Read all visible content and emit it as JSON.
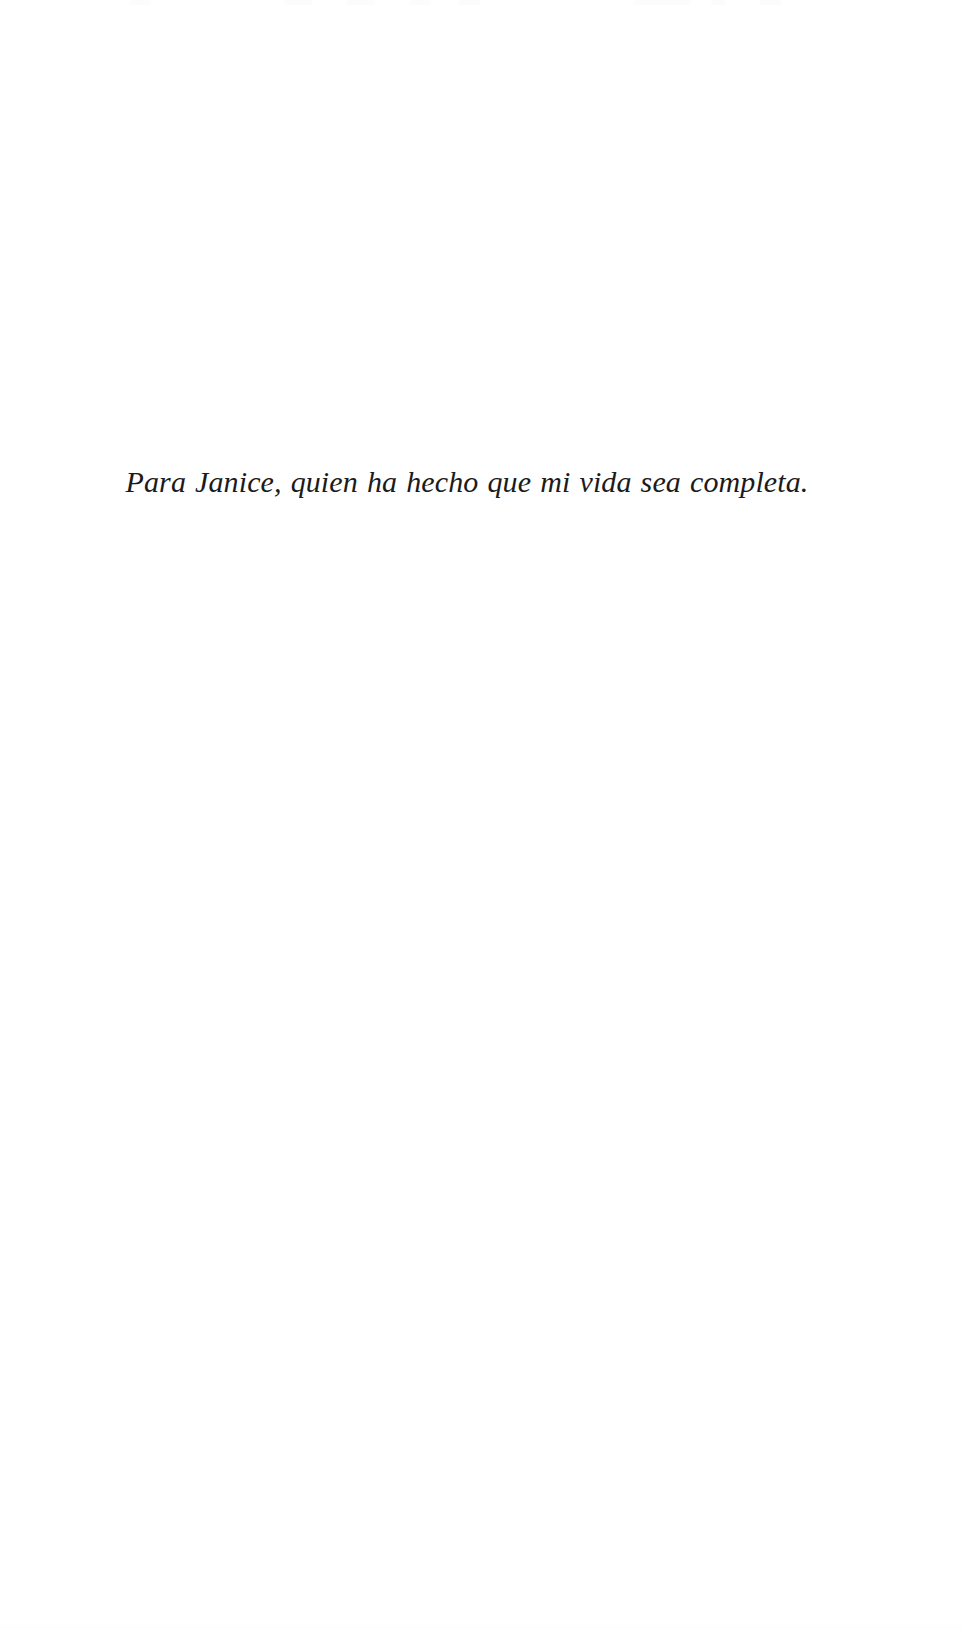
{
  "page": {
    "kind": "book-dedication-page",
    "background_color": "#ffffff",
    "width": 962,
    "height": 1629
  },
  "dedication": {
    "text": "Para Janice, quien ha hecho que mi vida sea completa.",
    "language": "es",
    "style": "italic",
    "alignment": "center",
    "text_color": "#1b1b1b"
  }
}
